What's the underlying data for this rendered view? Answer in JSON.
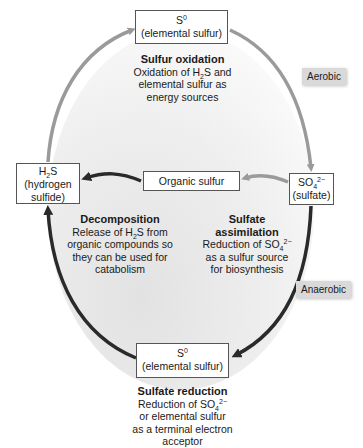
{
  "diagram": {
    "nodes": {
      "top_s0": {
        "formula": "S",
        "sup": "0",
        "name": "(elemental sulfur)"
      },
      "h2s": {
        "formula_pre": "H",
        "sub": "2",
        "formula_post": "S",
        "name_line1": "(hydrogen",
        "name_line2": "sulfide)"
      },
      "organic": {
        "label": "Organic sulfur"
      },
      "sulfate": {
        "formula_pre": "SO",
        "sub": "4",
        "sup": "2−",
        "name": "(sulfate)"
      },
      "bottom_s0": {
        "formula": "S",
        "sup": "0",
        "name": "(elemental sulfur)"
      }
    },
    "processes": {
      "oxidation": {
        "title": "Sulfur oxidation",
        "line1_pre": "Oxidation of H",
        "line1_sub": "2",
        "line1_post": "S and",
        "line2": "elemental sulfur as",
        "line3": "energy sources"
      },
      "decomposition": {
        "title": "Decomposition",
        "line1_pre": "Release of H",
        "line1_sub": "2",
        "line1_post": "S from",
        "line2": "organic compounds so",
        "line3": "they can be used for",
        "line4": "catabolism"
      },
      "assimilation": {
        "title_line1": "Sulfate",
        "title_line2": "assimilation",
        "line1_pre": "Reduction of SO",
        "line1_sub": "4",
        "line1_sup": "2−",
        "line2": "as a sulfur source",
        "line3": "for biosynthesis"
      },
      "reduction": {
        "title": "Sulfate reduction",
        "line1_pre": "Reduction of SO",
        "line1_sub": "4",
        "line1_sup": "2−",
        "line2": "or elemental sulfur",
        "line3": "as a terminal electron",
        "line4": "acceptor"
      }
    },
    "conditions": {
      "aerobic": "Aerobic",
      "anaerobic": "Anaerobic"
    },
    "colors": {
      "aerobic_arrow": "#9a9a9a",
      "anaerobic_arrow": "#2a2a2a",
      "box_border": "#555555",
      "tag_bg": "#d9d9d9",
      "fill_gradient_start": "#ececec",
      "fill_gradient_end": "#ffffff"
    }
  }
}
